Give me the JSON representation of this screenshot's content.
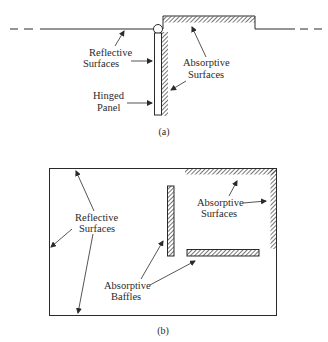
{
  "figure_a": {
    "caption": "(a)",
    "labels": {
      "reflective_line1": "Reflective",
      "reflective_line2": "Surfaces",
      "absorptive_line1": "Absorptive",
      "absorptive_line2": "Surfaces",
      "hinged_line1": "Hinged",
      "hinged_line2": "Panel"
    }
  },
  "figure_b": {
    "caption": "(b)",
    "labels": {
      "reflective_line1": "Reflective",
      "reflective_line2": "Surfaces",
      "absorptive_surfaces_line1": "Absorptive",
      "absorptive_surfaces_line2": "Surfaces",
      "baffles_line1": "Absorptive",
      "baffles_line2": "Baffles"
    }
  },
  "colors": {
    "ink": "#2a2a2a",
    "background": "#ffffff"
  }
}
